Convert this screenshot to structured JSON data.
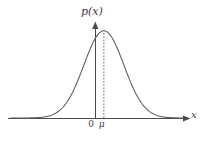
{
  "figure": {
    "background_color": "#ffffff",
    "curve_color": "#5a5a5a",
    "axis_color": "#4a4a4a",
    "guide_color": "#6b6b6b",
    "text_color": "#3d3d3d",
    "vertical_axis_label": "p(x)",
    "horizontal_axis_label": "x",
    "origin_tick_label": "0",
    "mean_tick_label": "μ",
    "guide_line_style": "dashed",
    "guide_line_name": "mean-dashed-line"
  },
  "chart_data": {
    "type": "line",
    "title": "",
    "subtitle": "",
    "xlabel": "x",
    "ylabel": "p(x)",
    "grid": false,
    "legend": false,
    "legend_position": "none",
    "xlim": [
      -4.6,
      4.9
    ],
    "ylim": [
      0,
      1.12
    ],
    "axis_ticks": {
      "x": [
        {
          "value": 0.0,
          "label": "0"
        },
        {
          "value": 0.5,
          "label": "μ"
        }
      ],
      "y": []
    },
    "annotations": [
      {
        "name": "mean-dashed-line",
        "type": "vline",
        "x": 0.5,
        "y_from": 0,
        "y_to": 1.0,
        "style": "dashed",
        "label": "μ"
      },
      {
        "name": "vertical-axis",
        "type": "vline",
        "x": 0.0,
        "y_from": 0,
        "y_to": 1.12,
        "style": "solid",
        "label": "p(x)"
      }
    ],
    "series": [
      {
        "name": "gaussian-density",
        "function": "exp(-(x-0.5)^2/(2*1.1^2))",
        "mean": 0.5,
        "sigma": 1.1,
        "peak_value": 1.0,
        "x": [
          -4.6,
          -4.2,
          -3.8,
          -3.4,
          -3.0,
          -2.6,
          -2.2,
          -1.8,
          -1.4,
          -1.0,
          -0.6,
          -0.2,
          0.2,
          0.5,
          0.8,
          1.2,
          1.6,
          2.0,
          2.4,
          2.8,
          3.2,
          3.6,
          4.0,
          4.4,
          4.9
        ],
        "values": [
          0.004,
          0.009,
          0.019,
          0.038,
          0.069,
          0.118,
          0.189,
          0.283,
          0.397,
          0.519,
          0.638,
          0.742,
          0.963,
          1.0,
          0.963,
          0.841,
          0.672,
          0.488,
          0.323,
          0.194,
          0.106,
          0.053,
          0.024,
          0.01,
          0.003
        ]
      }
    ]
  }
}
